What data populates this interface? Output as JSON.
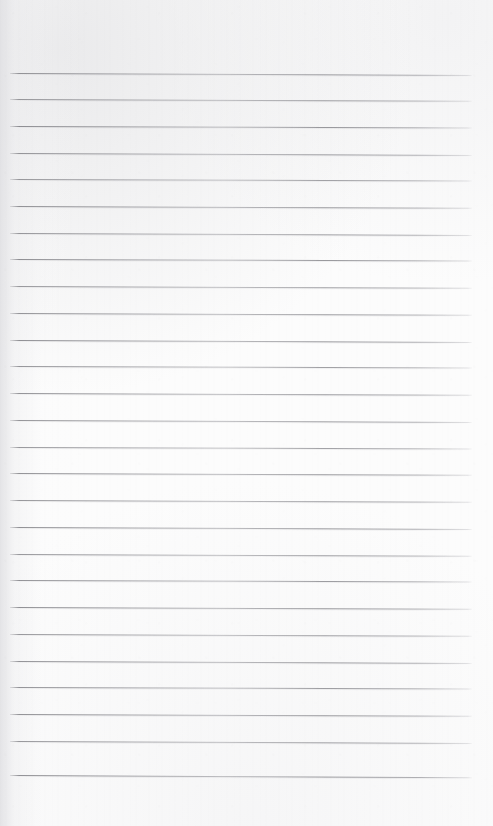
{
  "document": {
    "kind": "scanned-ruled-notebook-page",
    "title": "Blank Ruled Page",
    "page_width": 493,
    "page_height": 826,
    "paper_color": "#fcfcfc",
    "rule_color": "#8a8a8f",
    "text_content": "",
    "has_handwriting": false,
    "has_printed_text": false
  },
  "ruling": {
    "line_count": 27,
    "first_line_y": 73,
    "line_spacing": 27,
    "line_start_x": 10,
    "line_end_x": 472,
    "line_thickness": 1,
    "slant_degrees": 0.22,
    "margin_top": 73,
    "margin_bottom": 51,
    "margin_left": 10,
    "margin_right": 21,
    "lines": [
      {
        "y": 73,
        "opacity": 0.92,
        "slant": 0.26
      },
      {
        "y": 99,
        "opacity": 0.88,
        "slant": 0.22
      },
      {
        "y": 126,
        "opacity": 0.95,
        "slant": 0.2
      },
      {
        "y": 153,
        "opacity": 0.9,
        "slant": 0.24
      },
      {
        "y": 179,
        "opacity": 0.86,
        "slant": 0.18
      },
      {
        "y": 206,
        "opacity": 0.93,
        "slant": 0.22
      },
      {
        "y": 233,
        "opacity": 0.89,
        "slant": 0.25
      },
      {
        "y": 259,
        "opacity": 0.94,
        "slant": 0.2
      },
      {
        "y": 286,
        "opacity": 0.87,
        "slant": 0.23
      },
      {
        "y": 313,
        "opacity": 0.91,
        "slant": 0.21
      },
      {
        "y": 340,
        "opacity": 0.95,
        "slant": 0.24
      },
      {
        "y": 366,
        "opacity": 0.88,
        "slant": 0.19
      },
      {
        "y": 393,
        "opacity": 0.92,
        "slant": 0.22
      },
      {
        "y": 420,
        "opacity": 0.9,
        "slant": 0.26
      },
      {
        "y": 447,
        "opacity": 0.86,
        "slant": 0.2
      },
      {
        "y": 473,
        "opacity": 0.93,
        "slant": 0.23
      },
      {
        "y": 500,
        "opacity": 0.89,
        "slant": 0.21
      },
      {
        "y": 527,
        "opacity": 0.94,
        "slant": 0.25
      },
      {
        "y": 554,
        "opacity": 0.88,
        "slant": 0.22
      },
      {
        "y": 580,
        "opacity": 0.91,
        "slant": 0.19
      },
      {
        "y": 607,
        "opacity": 0.95,
        "slant": 0.23
      },
      {
        "y": 634,
        "opacity": 0.87,
        "slant": 0.21
      },
      {
        "y": 661,
        "opacity": 0.92,
        "slant": 0.24
      },
      {
        "y": 687,
        "opacity": 0.9,
        "slant": 0.2
      },
      {
        "y": 714,
        "opacity": 0.93,
        "slant": 0.22
      },
      {
        "y": 741,
        "opacity": 0.88,
        "slant": 0.26
      },
      {
        "y": 775,
        "opacity": 0.94,
        "slant": 0.28
      }
    ]
  }
}
